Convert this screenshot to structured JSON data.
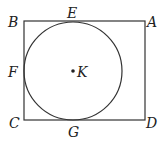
{
  "diagram": {
    "labels": {
      "A": "A",
      "B": "B",
      "C": "C",
      "D": "D",
      "E": "E",
      "F": "F",
      "G": "G",
      "K": "K"
    },
    "colors": {
      "stroke": "#333333",
      "text": "#222222"
    }
  }
}
